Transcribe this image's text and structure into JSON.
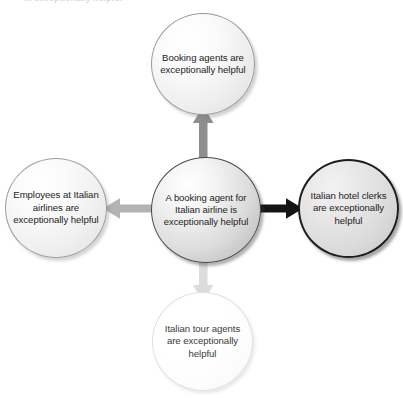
{
  "caption": {
    "text": "... exceptionally helpful"
  },
  "diagram": {
    "type": "radial-hub-and-spoke",
    "background_color": "#ffffff",
    "center": {
      "id": "center",
      "label": "A booking agent for Italian airline is exceptionally helpful",
      "fill_color": "#dcdcdc",
      "border_color": "#4a4a4a"
    },
    "nodes": [
      {
        "id": "top",
        "position": "top",
        "label": "Booking agents are exceptionally helpful",
        "fill_color": "#efefef",
        "border_color": "#9a9a9a"
      },
      {
        "id": "right",
        "position": "right",
        "label": "Italian hotel clerks are exceptionally helpful",
        "fill_color": "#dcdcdc",
        "border_color": "#1d1d1d"
      },
      {
        "id": "left",
        "position": "left",
        "label": "Employees at Italian airlines are exceptionally helpful",
        "fill_color": "#f0f0f0",
        "border_color": "#9d9d9d"
      },
      {
        "id": "bottom",
        "position": "bottom",
        "label": "Italian tour agents are exceptionally helpful",
        "fill_color": "#fcfcfc",
        "border_color": "#e0e0e0"
      }
    ],
    "arrows": [
      {
        "id": "arrow-up",
        "direction": "up",
        "from": "center",
        "to": "top",
        "color": "#8e8e8e"
      },
      {
        "id": "arrow-right",
        "direction": "right",
        "from": "center",
        "to": "right",
        "color": "#141414"
      },
      {
        "id": "arrow-left",
        "direction": "left",
        "from": "center",
        "to": "left",
        "color": "#b3b3b3"
      },
      {
        "id": "arrow-down",
        "direction": "down",
        "from": "center",
        "to": "bottom",
        "color": "#dcdcdc"
      }
    ]
  }
}
